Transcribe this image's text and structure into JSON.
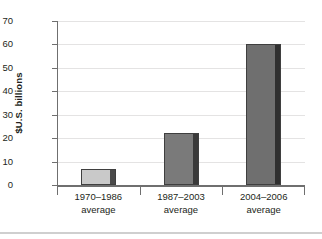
{
  "chart_data": {
    "type": "bar",
    "title": "",
    "xlabel": "",
    "ylabel": "$U.S. billions",
    "categories": [
      "1970–1986\naverage",
      "1987–2003\naverage",
      "2004–2006\naverage"
    ],
    "category_lines": [
      {
        "line1": "1970–1986",
        "line2": "average"
      },
      {
        "line1": "1987–2003",
        "line2": "average"
      },
      {
        "line1": "2004–2006",
        "line2": "average"
      }
    ],
    "values": [
      7,
      22,
      60
    ],
    "ylim": [
      0,
      70
    ],
    "ytick_step": 10,
    "yticks": [
      "0",
      "10",
      "20",
      "30",
      "40",
      "50",
      "60",
      "70"
    ],
    "ytick_values": [
      0,
      10,
      20,
      30,
      40,
      50,
      60,
      70
    ],
    "grid": true,
    "legend": "none",
    "bar_colors": [
      "#c9c9c9",
      "#7a7a7a",
      "#6f6f6f"
    ],
    "bar_edge_colors": [
      "#4a4a4a",
      "#3a3a3a",
      "#2f2f2f"
    ],
    "bar_outline_color": "#3f3f3f",
    "gridline_color": "#e3e2e1",
    "axis_color": "#6f6f6f",
    "text_color": "#231f20",
    "background_color": "#ffffff"
  }
}
